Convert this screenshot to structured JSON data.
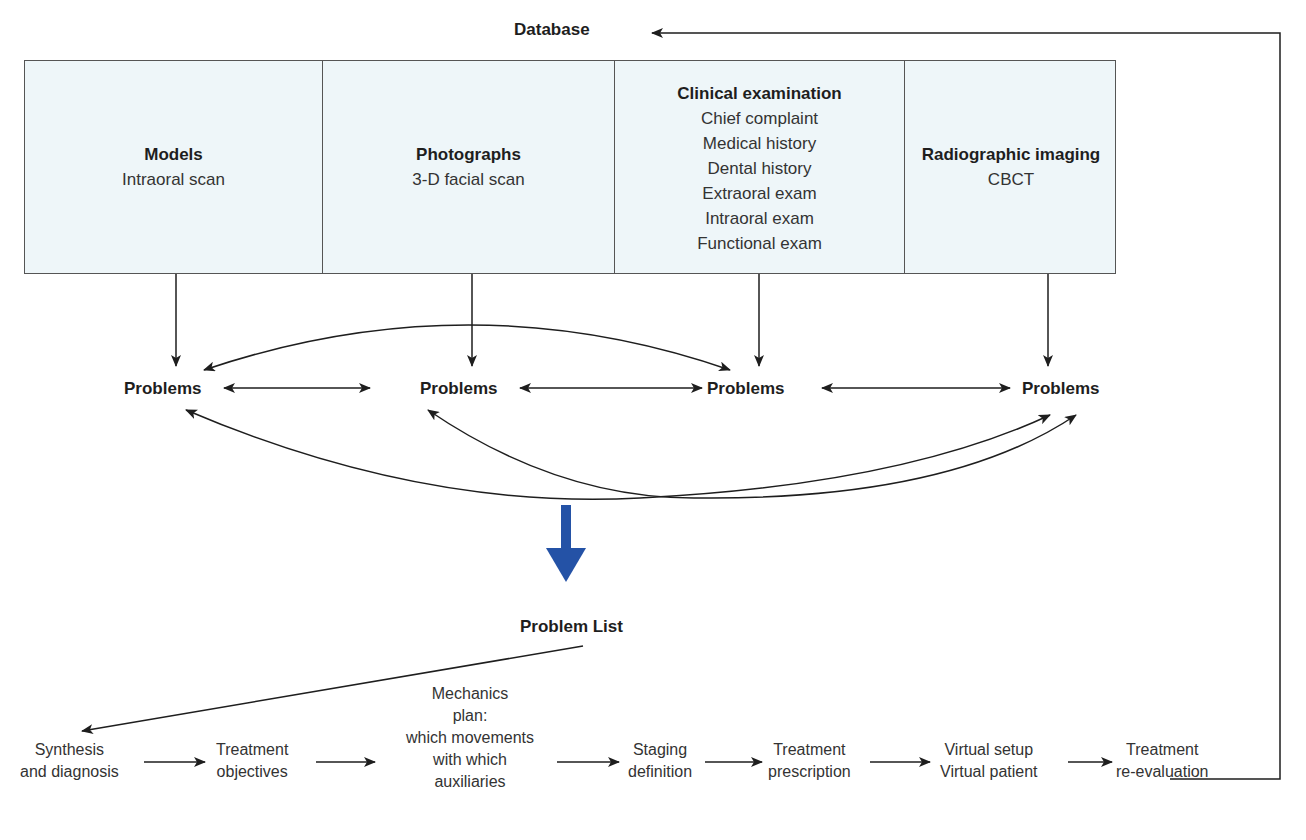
{
  "database": {
    "label": "Database"
  },
  "sources": [
    {
      "title": "Models",
      "items": [
        "Intraoral scan"
      ]
    },
    {
      "title": "Photographs",
      "items": [
        "3-D facial scan"
      ]
    },
    {
      "title": "Clinical examination",
      "items": [
        "Chief complaint",
        "Medical history",
        "Dental history",
        "Extraoral exam",
        "Intraoral exam",
        "Functional exam"
      ]
    },
    {
      "title": "Radiographic imaging",
      "items": [
        "CBCT"
      ]
    }
  ],
  "problems": [
    "Problems",
    "Problems",
    "Problems",
    "Problems"
  ],
  "problem_list": {
    "label": "Problem List"
  },
  "steps": [
    {
      "lines": [
        "Synthesis",
        "and diagnosis"
      ]
    },
    {
      "lines": [
        "Treatment",
        "objectives"
      ]
    },
    {
      "lines": [
        "Mechanics",
        "plan:",
        "which movements",
        "with which",
        "auxiliaries"
      ]
    },
    {
      "lines": [
        "Staging",
        "definition"
      ]
    },
    {
      "lines": [
        "Treatment",
        "prescription"
      ]
    },
    {
      "lines": [
        "Virtual setup",
        "Virtual patient"
      ]
    },
    {
      "lines": [
        "Treatment",
        "re-evaluation"
      ]
    }
  ],
  "colors": {
    "box_fill": "#eef6f9",
    "line": "#1e1e1e",
    "accent_arrow": "#2452a6"
  }
}
